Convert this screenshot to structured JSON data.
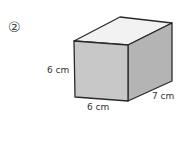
{
  "problem": {
    "number_label": "②",
    "shape": "rectangular prism",
    "dimensions": {
      "height": "6 cm",
      "width": "6 cm",
      "depth": "7 cm"
    }
  },
  "colors": {
    "front_face": "#c8c8c8",
    "side_face": "#b4b4b4",
    "top_face": "#f2f2f2",
    "edge": "#2a2a2a"
  }
}
